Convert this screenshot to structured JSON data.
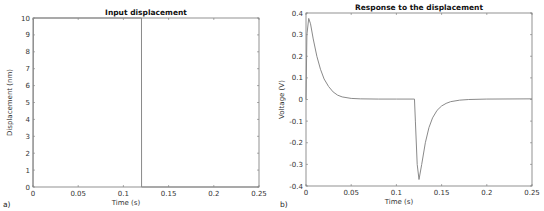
{
  "chart_data": [
    {
      "type": "line",
      "panel_label": "a)",
      "title": "Input displacement",
      "xlabel": "Time (s)",
      "ylabel": "Displacement (nm)",
      "xlim": [
        0,
        0.25
      ],
      "ylim": [
        0,
        10
      ],
      "xticks": [
        "0",
        "0.05",
        "0.1",
        "0.15",
        "0.2",
        "0.25"
      ],
      "yticks": [
        "0",
        "1",
        "2",
        "3",
        "4",
        "5",
        "6",
        "7",
        "8",
        "9",
        "10"
      ],
      "grid": false,
      "series": [
        {
          "name": "displacement",
          "x": [
            0,
            0.0005,
            0.12,
            0.1201,
            0.25
          ],
          "y": [
            0,
            10,
            10,
            0,
            0
          ]
        }
      ]
    },
    {
      "type": "line",
      "panel_label": "b)",
      "title": "Response to the displacement",
      "xlabel": "Time (s)",
      "ylabel": "Voltage (V)",
      "xlim": [
        0,
        0.25
      ],
      "ylim": [
        -0.4,
        0.4
      ],
      "xticks": [
        "0",
        "0.05",
        "0.1",
        "0.15",
        "0.2",
        "0.25"
      ],
      "yticks": [
        "-0.4",
        "-0.3",
        "-0.2",
        "-0.1",
        "0",
        "0.1",
        "0.2",
        "0.3",
        "0.4"
      ],
      "grid": false,
      "series": [
        {
          "name": "voltage",
          "x": [
            0,
            0.001,
            0.003,
            0.005,
            0.008,
            0.012,
            0.016,
            0.02,
            0.025,
            0.03,
            0.035,
            0.04,
            0.05,
            0.06,
            0.08,
            0.1,
            0.12,
            0.121,
            0.123,
            0.125,
            0.128,
            0.132,
            0.136,
            0.14,
            0.145,
            0.15,
            0.155,
            0.16,
            0.17,
            0.18,
            0.2,
            0.25
          ],
          "y": [
            0,
            0.3,
            0.375,
            0.35,
            0.28,
            0.2,
            0.14,
            0.095,
            0.06,
            0.035,
            0.02,
            0.012,
            0.005,
            0.003,
            0.002,
            0.002,
            0.002,
            -0.1,
            -0.3,
            -0.37,
            -0.3,
            -0.2,
            -0.13,
            -0.085,
            -0.05,
            -0.03,
            -0.018,
            -0.01,
            -0.003,
            0.0,
            0.002,
            0.003
          ]
        }
      ]
    }
  ]
}
